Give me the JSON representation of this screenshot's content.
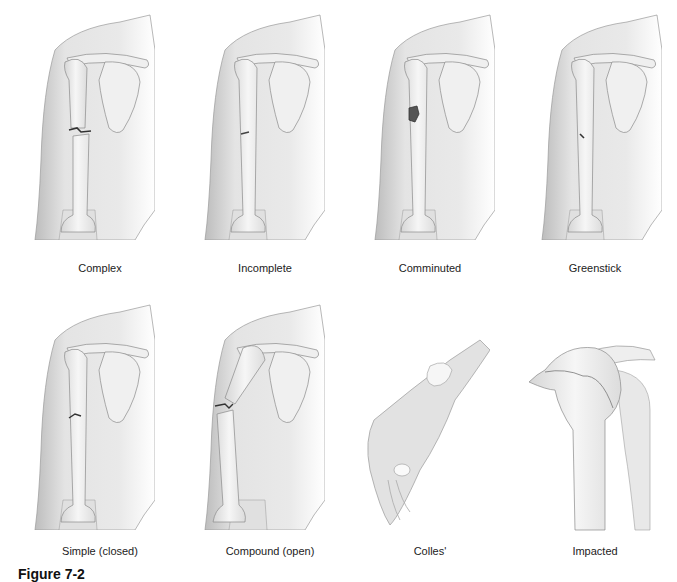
{
  "figure": {
    "caption_partial": "Figure 7-2",
    "panels": [
      {
        "id": "complex",
        "label": "Complex"
      },
      {
        "id": "incomplete",
        "label": "Incomplete"
      },
      {
        "id": "comminuted",
        "label": "Comminuted"
      },
      {
        "id": "greenstick",
        "label": "Greenstick"
      },
      {
        "id": "simple",
        "label": "Simple (closed)"
      },
      {
        "id": "compound",
        "label": "Compound (open)"
      },
      {
        "id": "colles",
        "label": "Colles'"
      },
      {
        "id": "impacted",
        "label": "Impacted"
      }
    ]
  },
  "colors": {
    "skin": "#e6e6e6",
    "skin_shadow": "#bdbdbd",
    "bone": "#f2f2f2",
    "outline": "#8a8a8a",
    "fracture": "#3a3a3a"
  }
}
